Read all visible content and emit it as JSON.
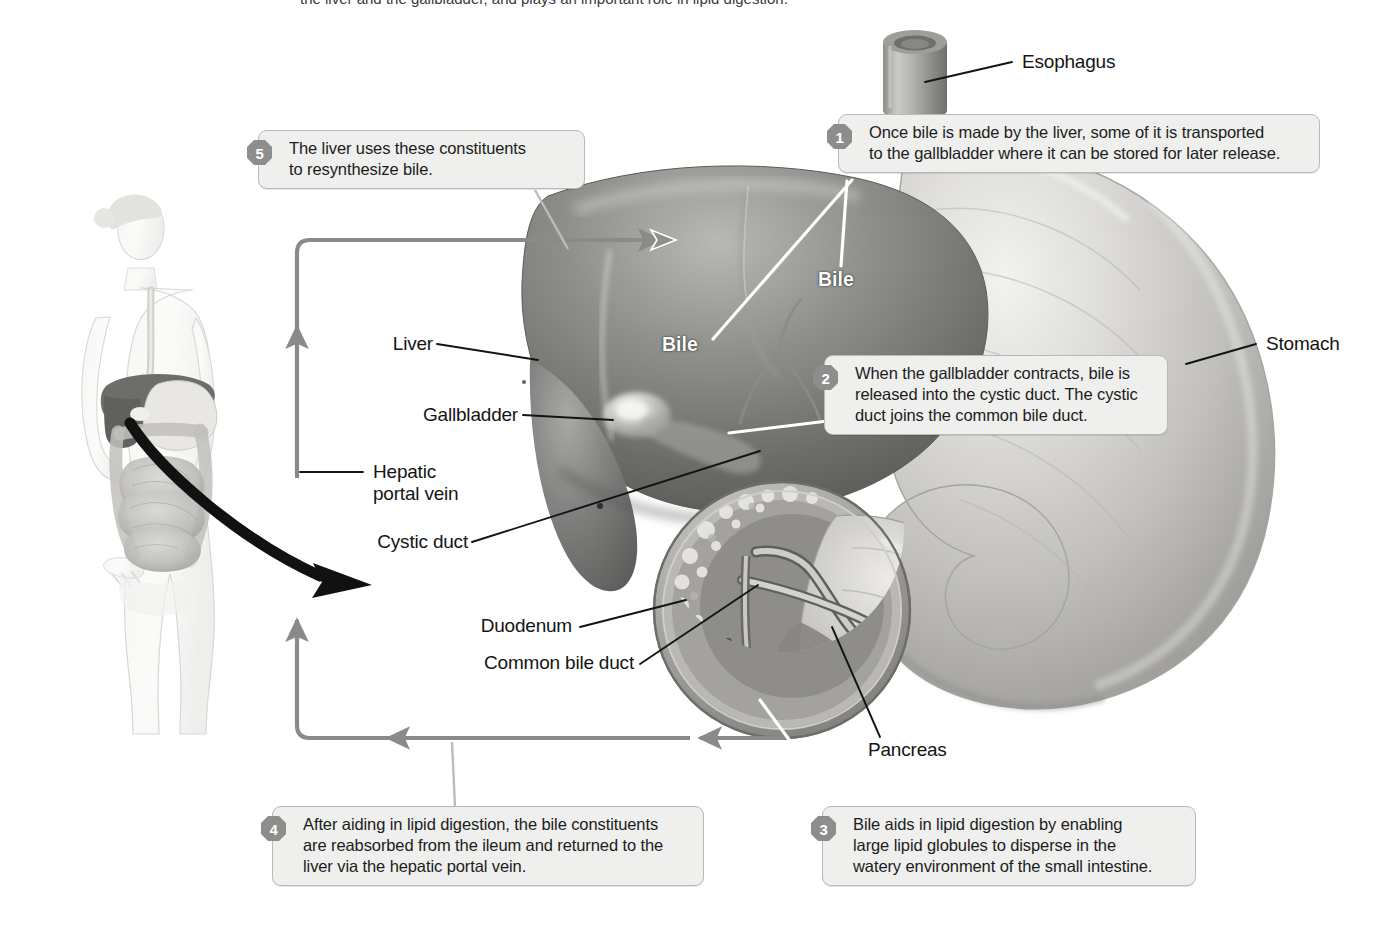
{
  "figure": {
    "title_partial": "the liver and the gallbladder, and plays an important role in lipid digestion."
  },
  "steps": [
    {
      "number": "1",
      "text": "Once bile is made by the liver, some of it is transported\nto the gallbladder where it can be stored for later release."
    },
    {
      "number": "2",
      "text": "When the gallbladder contracts, bile is\nreleased into the cystic duct. The cystic\nduct joins the common bile duct."
    },
    {
      "number": "3",
      "text": "Bile aids in lipid digestion by enabling\nlarge lipid globules to disperse in the\nwatery environment of the small intestine."
    },
    {
      "number": "4",
      "text": "After aiding in lipid digestion, the bile constituents\nare reabsorbed from the ileum and returned to the\nliver via the hepatic portal vein."
    },
    {
      "number": "5",
      "text": "The liver uses these constituents\nto resynthesize bile."
    }
  ],
  "labels": {
    "esophagus": "Esophagus",
    "stomach": "Stomach",
    "liver": "Liver",
    "gallbladder": "Gallbladder",
    "hepatic_portal_vein": "Hepatic\nportal vein",
    "cystic_duct": "Cystic duct",
    "duodenum": "Duodenum",
    "common_bile_duct": "Common bile duct",
    "pancreas": "Pancreas",
    "bile_upper": "Bile",
    "bile_lower": "Bile"
  },
  "colors": {
    "callout_fill": "#efefee",
    "callout_border": "#b9b9b7",
    "badge_fill": "#8d8d8b",
    "badge_text": "#ffffff",
    "flow_arrow": "#8a8a88",
    "leader_line": "#141414",
    "white_leader": "#ffffff",
    "black_arrow": "#111111",
    "text": "#141414",
    "organ_dark": "#6f6f6d",
    "organ_mid": "#9b9b99",
    "organ_light": "#cfcfcc",
    "background": "#ffffff"
  }
}
